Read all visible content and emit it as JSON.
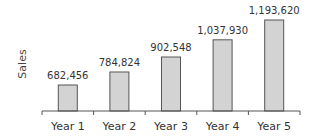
{
  "chart_data": {
    "type": "bar",
    "title": "",
    "xlabel": "",
    "ylabel": "Sales",
    "categories": [
      "Year 1",
      "Year 2",
      "Year 3",
      "Year 4",
      "Year 5"
    ],
    "values": [
      682456,
      784824,
      902548,
      1037930,
      1193620
    ],
    "value_labels": [
      "682,456",
      "784,824",
      "902,548",
      "1,037,930",
      "1,193,620"
    ],
    "ylim": [
      360000,
      1250000
    ],
    "grid": false,
    "legend": null,
    "bar_color": "#d3d3d3",
    "bar_stroke": "#555555"
  }
}
